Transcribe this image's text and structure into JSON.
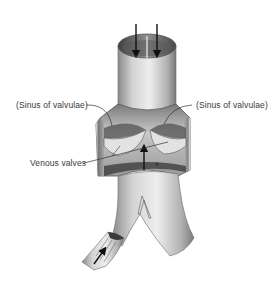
{
  "figure": {
    "labels": {
      "sinus_left": "(Sinus of valvulae)",
      "sinus_right": "(Sinus of valvulae)",
      "venous_valves": "Venous valves"
    },
    "arrows": [
      {
        "name": "flow-arrow-top-left",
        "direction": "down"
      },
      {
        "name": "flow-arrow-top-right",
        "direction": "down"
      },
      {
        "name": "flow-arrow-middle",
        "direction": "up"
      },
      {
        "name": "flow-arrow-branch",
        "direction": "up-right"
      }
    ],
    "colors": {
      "background": "#ffffff",
      "vessel_light": "#d9d9d9",
      "vessel_mid": "#9a9a9a",
      "vessel_dark": "#4a4a4a",
      "label_text": "#3a3a3a",
      "arrow": "#111111"
    }
  }
}
